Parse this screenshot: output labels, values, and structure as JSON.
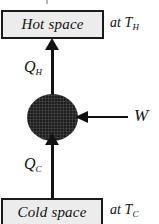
{
  "diagram": {
    "type": "thermodynamic-heat-pump-cycle",
    "hot_reservoir": {
      "box_label": "Hot space",
      "temperature_prefix": "at T",
      "temperature_subscript": "H"
    },
    "cold_reservoir": {
      "box_label": "Cold space",
      "temperature_prefix": "at T",
      "temperature_subscript": "C"
    },
    "flows": {
      "heat_out": {
        "symbol": "Q",
        "subscript": "H",
        "direction": "up"
      },
      "heat_in": {
        "symbol": "Q",
        "subscript": "C",
        "direction": "up"
      },
      "work_in": {
        "symbol": "W",
        "subscript": "",
        "direction": "left"
      }
    },
    "colors": {
      "box_fill": "#ececed",
      "box_border": "#1a1a1a",
      "arrow": "#121212",
      "device": "#1e1e1e",
      "background": "#ffffff"
    }
  }
}
